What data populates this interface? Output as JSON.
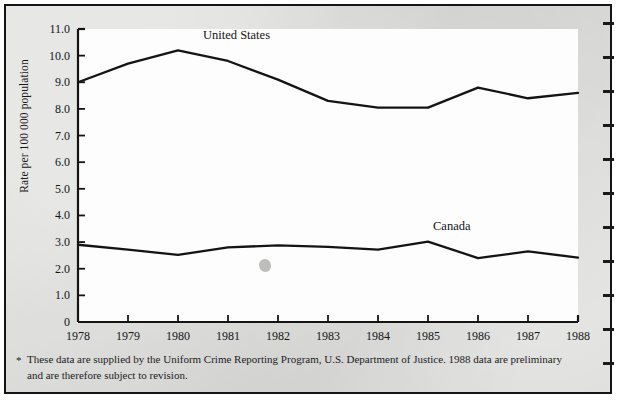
{
  "chart_data": {
    "type": "line",
    "title": "",
    "xlabel": "",
    "ylabel": "Rate per 100 000 population",
    "x": [
      1978,
      1979,
      1980,
      1981,
      1982,
      1983,
      1984,
      1985,
      1986,
      1987,
      1988
    ],
    "xtick_labels": [
      "1978",
      "1979",
      "1980",
      "1981",
      "1982",
      "1983",
      "1984",
      "1985",
      "1986",
      "1987",
      "1988"
    ],
    "ytick_labels": [
      "11.0",
      "10.0",
      "9.0",
      "8.0",
      "7.0",
      "6.0",
      "5.0",
      "4.0",
      "3.0",
      "2.0",
      "1.0",
      "0"
    ],
    "yticks": [
      11.0,
      10.0,
      9.0,
      8.0,
      7.0,
      6.0,
      5.0,
      4.0,
      3.0,
      2.0,
      1.0,
      0
    ],
    "ylim": [
      0,
      11.0
    ],
    "xlim": [
      1978,
      1988
    ],
    "grid": false,
    "legend_position": "inline-annotation",
    "series": [
      {
        "name": "United States",
        "color": "#141414",
        "label_x": 1980.5,
        "label_y": 10.75,
        "values": [
          9.0,
          9.7,
          10.2,
          9.8,
          9.1,
          8.3,
          8.05,
          8.05,
          8.8,
          8.4,
          8.6
        ]
      },
      {
        "name": "Canada",
        "color": "#141414",
        "label_x": 1985.1,
        "label_y": 3.55,
        "values": [
          2.9,
          2.72,
          2.52,
          2.8,
          2.88,
          2.82,
          2.72,
          3.02,
          2.4,
          2.65,
          2.42
        ]
      }
    ],
    "annotations": [
      {
        "name": "united-states-label",
        "text": "United States"
      },
      {
        "name": "canada-label",
        "text": "Canada"
      }
    ]
  },
  "footnote": {
    "marker": "*",
    "text": "These data are supplied by the Uniform Crime Reporting Program, U.S. Department of Justice. 1988 data are preliminary and are therefore subject to revision."
  },
  "edge_marks": {
    "name": "page-edge-tick-marks",
    "count": 11
  }
}
